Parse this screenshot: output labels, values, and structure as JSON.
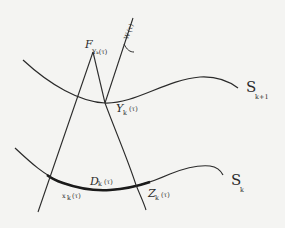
{
  "diagram": {
    "type": "geometric-sketch",
    "background": "#f4f4f2",
    "stroke_color": "#2a2a2a",
    "curves": [
      {
        "id": "S_k_plus_1",
        "label": "S",
        "subscript": "k+1"
      },
      {
        "id": "S_k",
        "label": "S",
        "subscript": "k"
      }
    ],
    "lines": [
      {
        "id": "F",
        "label": "F",
        "subscript": "Y_k(τ)"
      },
      {
        "id": "W",
        "label": "W",
        "subscript": "u",
        "superscript": "(τ)"
      }
    ],
    "points": [
      {
        "id": "Y",
        "label": "Y",
        "subscript": "k",
        "arg": "(τ)"
      },
      {
        "id": "X",
        "label": "x",
        "subscript": "k",
        "arg": "(τ)"
      },
      {
        "id": "Z",
        "label": "Z",
        "subscript": "k",
        "arg": "(τ)"
      }
    ],
    "segment": {
      "id": "D",
      "label": "D",
      "subscript": "k",
      "arg": "(τ)"
    },
    "texts": {
      "F": "F",
      "F_sub": "Yₖ(τ)",
      "W": "W",
      "W_sup": "u",
      "W_arg": "(τ)",
      "Y": "Y",
      "Y_sub": "k",
      "Y_arg": "(τ)",
      "X": "x",
      "X_sub": "k",
      "X_arg": "(τ)",
      "Z": "Z",
      "Z_sub": "k",
      "Z_arg": "(τ)",
      "D": "D",
      "D_sub": "k",
      "D_arg": "(τ)",
      "S_top": "S",
      "S_top_sub": "k+1",
      "S_bot": "S",
      "S_bot_sub": "k"
    }
  }
}
